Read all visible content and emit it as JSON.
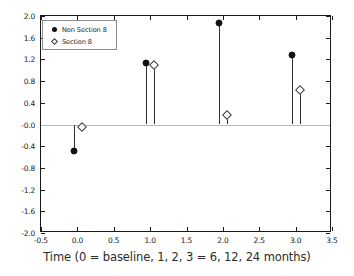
{
  "chart_data": {
    "type": "scatter",
    "title": "",
    "subtitle": "",
    "xlabel": "Time (0 = baseline, 1, 2, 3 = 6, 12, 24 months)",
    "ylabel": "",
    "xlim": [
      -0.5,
      3.5
    ],
    "ylim": [
      -2.0,
      2.0
    ],
    "grid": false,
    "zero_reference_line": 0.0,
    "legend_position": "upper-left",
    "xticks": [
      "-0.5",
      "0.0",
      "0.5",
      "1.0",
      "1.5",
      "2.0",
      "2.5",
      "3.0",
      "3.5"
    ],
    "xtick_values": [
      -0.5,
      0.0,
      0.5,
      1.0,
      1.5,
      2.0,
      2.5,
      3.0,
      3.5
    ],
    "yticks": [
      "2.0",
      "1.6",
      "1.2",
      "0.8",
      "0.4",
      "-0.0",
      "-0.4",
      "-0.8",
      "-1.2",
      "-1.6",
      "-2.0"
    ],
    "ytick_values": [
      2.0,
      1.6,
      1.2,
      0.8,
      0.4,
      0.0,
      -0.4,
      -0.8,
      -1.2,
      -1.6,
      -2.0
    ],
    "categories": [
      0,
      1,
      2,
      3
    ],
    "series": [
      {
        "name": "Non Section 8",
        "marker": "filled-circle",
        "color": "#111111",
        "x": [
          -0.05,
          0.95,
          1.95,
          2.95
        ],
        "values": [
          -0.49,
          1.13,
          1.88,
          1.28
        ]
      },
      {
        "name": "Section 8",
        "marker": "open-diamond",
        "color": "#ffffff",
        "x": [
          0.06,
          1.06,
          2.06,
          3.06
        ],
        "values": [
          -0.05,
          1.09,
          0.18,
          0.63
        ]
      }
    ]
  },
  "legend": {
    "items": [
      {
        "label": "Non Section 8",
        "marker": "filled-circle"
      },
      {
        "label": "Section 8",
        "marker": "open-diamond"
      }
    ]
  },
  "axis": {
    "x_title": "Time (0 = baseline, 1, 2, 3 = 6, 12, 24 months)"
  }
}
